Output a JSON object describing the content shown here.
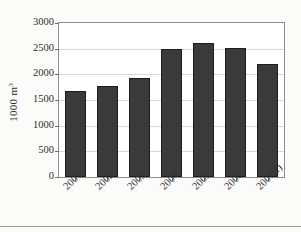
{
  "chart_data": {
    "type": "bar",
    "title": "",
    "xlabel": "",
    "ylabel": "1000 m",
    "ylabel_sup": "3",
    "categories": [
      "2001",
      "2002",
      "2003",
      "2004",
      "2005",
      "2006",
      "2007(f)"
    ],
    "values": [
      1675,
      1775,
      1925,
      2490,
      2615,
      2505,
      2205
    ],
    "ylim": [
      0,
      3000
    ],
    "ytick_labels": [
      "0",
      "500",
      "1000",
      "1500",
      "2000",
      "2500",
      "3000"
    ],
    "ytick_values": [
      0,
      500,
      1000,
      1500,
      2000,
      2500,
      3000
    ],
    "grid": true,
    "legend": false,
    "legend_position": "none",
    "bar_color": "#3a3a3a",
    "plot_border_color": "#8e8e8e",
    "gridline_color": "#d8d8d8"
  }
}
